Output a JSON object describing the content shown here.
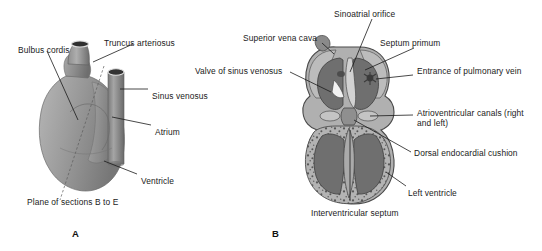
{
  "figure": {
    "panels": [
      {
        "letter": "A",
        "letter_pos": {
          "x": 72,
          "y": 228
        },
        "labels": [
          {
            "id": "bulbus-cordis",
            "text": "Bulbus cordis",
            "x": 18,
            "y": 45
          },
          {
            "id": "truncus-arteriosus",
            "text": "Truncus arteriosus",
            "x": 104,
            "y": 38
          },
          {
            "id": "sinus-venosus",
            "text": "Sinus venosus",
            "x": 152,
            "y": 91
          },
          {
            "id": "atrium",
            "text": "Atrium",
            "x": 155,
            "y": 127
          },
          {
            "id": "ventricle",
            "text": "Ventricle",
            "x": 141,
            "y": 176
          },
          {
            "id": "plane-of-sections",
            "text": "Plane of sections B to E",
            "x": 27,
            "y": 197
          }
        ]
      },
      {
        "letter": "B",
        "letter_pos": {
          "x": 272,
          "y": 228
        },
        "labels": [
          {
            "id": "sinoatrial-orifice",
            "text": "Sinoatrial orifice",
            "x": 334,
            "y": 9
          },
          {
            "id": "superior-vena-cava",
            "text": "Superior vena cava",
            "x": 243,
            "y": 33
          },
          {
            "id": "septum-primum",
            "text": "Septum primum",
            "x": 380,
            "y": 38
          },
          {
            "id": "valve-of-sinus-venosus",
            "text": "Valve of sinus venosus",
            "x": 195,
            "y": 66
          },
          {
            "id": "entrance-of-pulmonary-vein",
            "text": "Entrance of pulmonary vein",
            "x": 417,
            "y": 66
          },
          {
            "id": "atrioventricular-canals",
            "text": "Atrioventricular canals (right and left)",
            "x": 417,
            "y": 108
          },
          {
            "id": "dorsal-endocardial-cushion",
            "text": "Dorsal endocardial cushion",
            "x": 414,
            "y": 148
          },
          {
            "id": "left-ventricle",
            "text": "Left ventricle",
            "x": 408,
            "y": 188
          },
          {
            "id": "interventricular-septum",
            "text": "Interventricular septum",
            "x": 311,
            "y": 208
          }
        ]
      }
    ],
    "colors": {
      "background": "#ffffff",
      "text": "#1a1a1a",
      "leader_line": "#1b1b1b",
      "plane_line": "#5c5c5c",
      "tissue_light": "#b9b9b9",
      "tissue_mid": "#9a9a9a",
      "tissue_dark": "#7c7c7c",
      "lumen_dark": "#6f6f6f",
      "wall_outline": "#4a4a4a",
      "myocardium_speckle": "#585858"
    },
    "alt_description": "Two-panel grayscale embryology figure of the developing heart. Panel A is an external view of the primitive heart tube showing bulbus cordis, truncus arteriosus, sinus venosus, atrium and ventricle, with a dashed plane of sections B to E. Panel B is a coronal section showing atrial and ventricular chambers, septum primum, endocardial cushions and the interventricular septum."
  }
}
